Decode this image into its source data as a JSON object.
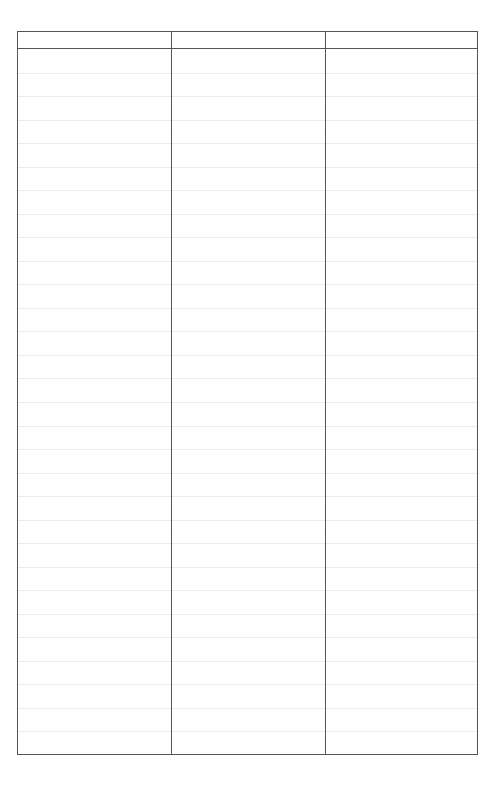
{
  "document": {
    "type": "blank ruled table form",
    "columns": [
      {
        "header": ""
      },
      {
        "header": ""
      },
      {
        "header": ""
      }
    ],
    "row_count": 30,
    "rows": [],
    "colors": {
      "border": "#555555",
      "rule": "#ececec",
      "background": "#ffffff"
    }
  }
}
